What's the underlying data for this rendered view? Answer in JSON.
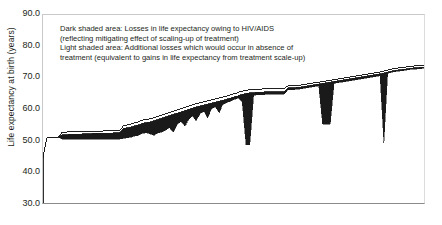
{
  "axis": {
    "y_title": "Life expectancy at birth (years)",
    "y_ticks": [
      "90.0",
      "80.0",
      "70.0",
      "60.0",
      "50.0",
      "40.0",
      "30.0"
    ]
  },
  "legend": {
    "line1": "Dark shaded area: Losses in life expectancy owing to HIV/AIDS",
    "line2": "(reflecting mitigating effect of scaling-up of treatment)",
    "line3": "Light shaded area: Additional losses which would occur in absence of",
    "line4": "treatment (equivalent to gains in life expectancy from treatment scale-up)"
  },
  "country_labels": [
    {
      "name": "Sierra Leone",
      "text": "Sierra\nLeone",
      "orient": "horiz",
      "x": 2,
      "y": 147
    },
    {
      "name": "Nigeria",
      "text": "Nigeria",
      "orient": "horiz",
      "x": 22,
      "y": 112
    },
    {
      "name": "Mozambique",
      "text": "Mo-\nzam-\nbique",
      "orient": "horiz",
      "x": 61,
      "y": 147
    },
    {
      "name": "Malawi",
      "text": "Malawi",
      "orient": "vert",
      "x": 101,
      "y": 178
    },
    {
      "name": "Zambia",
      "text": "Zambia",
      "orient": "vert",
      "x": 131,
      "y": 166
    },
    {
      "name": "Swaziland",
      "text": "Swazi-\nland",
      "orient": "horiz",
      "x": 118,
      "y": 161
    },
    {
      "name": "Lesotho",
      "text": "Lesotho",
      "orient": "vert",
      "x": 166,
      "y": 173
    },
    {
      "name": "South Africa",
      "text": "South Africa",
      "orient": "vert",
      "x": 213,
      "y": 180
    },
    {
      "name": "Zimbabwe",
      "text": "Zimbabwe",
      "orient": "vert",
      "x": 251,
      "y": 180
    },
    {
      "name": "Namibia Botswana",
      "text": "Namibia,\nBotswana",
      "orient": "vert",
      "x": 265,
      "y": 180
    }
  ],
  "chart_data": {
    "type": "area",
    "title": "",
    "xlabel": "",
    "ylabel": "Life expectancy at birth (years)",
    "ylim": [
      30.0,
      90.0
    ],
    "y_ticks": [
      30.0,
      40.0,
      50.0,
      60.0,
      70.0,
      80.0,
      90.0
    ],
    "grid": false,
    "legend_position": "inside-top-left",
    "colors": {
      "dark_shade": "#1a1a1a",
      "light_shade": "#ffffff",
      "line": "#1a1a1a",
      "frame": "#8a8a8a"
    },
    "series": [
      {
        "name": "Life expectancy with treatment scale-up (upper outline)",
        "description": "Rising step curve of country life expectancies sorted ascending",
        "x": [
          0,
          1,
          2,
          3,
          4,
          5,
          6,
          7,
          8,
          9,
          10,
          11,
          12,
          13,
          14,
          15,
          16,
          17,
          18,
          19,
          20,
          21,
          22,
          23,
          24,
          25,
          26,
          27,
          28,
          29,
          30,
          31,
          32,
          33,
          34,
          35,
          36,
          37,
          38,
          39,
          40,
          41,
          42,
          43,
          44,
          45,
          46,
          47,
          48,
          49,
          50,
          51,
          52,
          53,
          54,
          55,
          56,
          57,
          58,
          59,
          60,
          61,
          62,
          63,
          64,
          65,
          66,
          67,
          68,
          69,
          70,
          71,
          72,
          73,
          74,
          75,
          76,
          77,
          78,
          79,
          80,
          81,
          82,
          83,
          84,
          85,
          86,
          87,
          88,
          89,
          90,
          91,
          92,
          93,
          94,
          95,
          96,
          97,
          98,
          99,
          100
        ],
        "values": [
          45.0,
          51.2,
          51.2,
          51.2,
          51.4,
          53.0,
          53.0,
          53.2,
          53.2,
          53.2,
          53.2,
          53.3,
          53.3,
          53.3,
          53.3,
          53.3,
          53.4,
          53.4,
          53.4,
          53.4,
          53.5,
          55.0,
          55.3,
          55.6,
          56.0,
          56.3,
          56.8,
          57.0,
          57.2,
          57.6,
          58.0,
          58.4,
          58.8,
          59.2,
          59.6,
          60.0,
          60.4,
          60.8,
          61.2,
          61.6,
          62.0,
          62.3,
          62.6,
          62.9,
          63.2,
          63.5,
          63.8,
          64.1,
          64.4,
          64.8,
          65.2,
          65.6,
          65.9,
          66.2,
          66.4,
          66.5,
          66.6,
          66.6,
          66.7,
          66.7,
          66.7,
          66.8,
          66.8,
          66.8,
          67.6,
          67.6,
          67.7,
          67.8,
          68.0,
          68.2,
          68.4,
          68.6,
          68.8,
          69.0,
          69.2,
          69.4,
          69.6,
          69.8,
          70.0,
          70.2,
          70.4,
          70.6,
          70.8,
          71.0,
          71.2,
          71.4,
          71.6,
          71.8,
          72.0,
          72.3,
          72.6,
          72.9,
          73.1,
          73.3,
          73.4,
          73.6,
          73.8,
          73.9,
          74.0,
          74.1,
          74.2
        ]
      },
      {
        "name": "Life expectancy with current treatment (boundary dark/light)",
        "description": "Lower edge of light band; top of dark band",
        "x": [
          0,
          1,
          2,
          3,
          4,
          5,
          6,
          7,
          8,
          9,
          10,
          11,
          12,
          13,
          14,
          15,
          16,
          17,
          18,
          19,
          20,
          21,
          22,
          23,
          24,
          25,
          26,
          27,
          28,
          29,
          30,
          31,
          32,
          33,
          34,
          35,
          36,
          37,
          38,
          39,
          40,
          41,
          42,
          43,
          44,
          45,
          46,
          47,
          48,
          49,
          50,
          51,
          52,
          53,
          54,
          55,
          56,
          57,
          58,
          59,
          60,
          61,
          62,
          63,
          64,
          65,
          66,
          67,
          68,
          69,
          70,
          71,
          72,
          73,
          74,
          75,
          76,
          77,
          78,
          79,
          80,
          81,
          82,
          83,
          84,
          85,
          86,
          87,
          88,
          89,
          90,
          91,
          92,
          93,
          94,
          95,
          96,
          97,
          98,
          99,
          100
        ],
        "values": [
          45.0,
          51.2,
          51.2,
          51.2,
          51.4,
          52.2,
          52.2,
          52.3,
          52.3,
          52.4,
          52.4,
          52.5,
          52.5,
          52.6,
          52.6,
          52.6,
          52.7,
          52.7,
          52.7,
          52.8,
          52.8,
          54.2,
          54.4,
          54.6,
          55.0,
          55.3,
          55.8,
          56.0,
          56.2,
          56.6,
          57.0,
          57.4,
          57.8,
          58.2,
          58.6,
          59.0,
          59.4,
          59.8,
          60.2,
          60.6,
          61.0,
          61.3,
          61.6,
          61.9,
          62.2,
          62.5,
          62.8,
          63.1,
          63.4,
          63.8,
          64.2,
          64.6,
          64.9,
          65.2,
          65.4,
          65.5,
          65.6,
          65.6,
          65.7,
          65.7,
          65.7,
          65.8,
          65.8,
          65.8,
          67.0,
          67.0,
          67.1,
          67.2,
          67.4,
          67.6,
          67.8,
          68.0,
          68.2,
          68.4,
          68.6,
          68.8,
          69.0,
          69.2,
          69.4,
          69.6,
          69.8,
          70.0,
          70.2,
          70.4,
          70.6,
          70.8,
          71.0,
          71.2,
          71.4,
          71.7,
          72.0,
          72.3,
          72.5,
          72.7,
          72.8,
          73.0,
          73.2,
          73.3,
          73.4,
          73.5,
          73.6
        ]
      },
      {
        "name": "Life expectancy without any treatment (bottom of dark band)",
        "description": "Lower edge of dark band; deep dips at Lesotho, South Africa, Zimbabwe",
        "x": [
          0,
          1,
          2,
          3,
          4,
          5,
          6,
          7,
          8,
          9,
          10,
          11,
          12,
          13,
          14,
          15,
          16,
          17,
          18,
          19,
          20,
          21,
          22,
          23,
          24,
          25,
          26,
          27,
          28,
          29,
          30,
          31,
          32,
          33,
          34,
          35,
          36,
          37,
          38,
          39,
          40,
          41,
          42,
          43,
          44,
          45,
          46,
          47,
          48,
          49,
          50,
          51,
          52,
          53,
          54,
          55,
          56,
          57,
          58,
          59,
          60,
          61,
          62,
          63,
          64,
          65,
          66,
          67,
          68,
          69,
          70,
          71,
          72,
          73,
          74,
          75,
          76,
          77,
          78,
          79,
          80,
          81,
          82,
          83,
          84,
          85,
          86,
          87,
          88,
          89,
          90,
          91,
          92,
          93,
          94,
          95,
          96,
          97,
          98,
          99,
          100
        ],
        "values": [
          45.0,
          51.2,
          51.2,
          51.2,
          51.4,
          50.8,
          50.8,
          50.8,
          50.8,
          50.8,
          50.8,
          50.8,
          50.8,
          50.8,
          50.8,
          50.8,
          50.8,
          50.8,
          50.8,
          50.8,
          50.8,
          51.0,
          51.2,
          51.4,
          51.8,
          52.0,
          52.6,
          52.8,
          52.4,
          52.0,
          52.8,
          53.0,
          53.6,
          54.4,
          53.0,
          55.4,
          56.4,
          55.0,
          57.0,
          58.2,
          56.6,
          58.8,
          59.6,
          57.4,
          60.4,
          61.0,
          59.2,
          61.8,
          62.4,
          62.8,
          63.4,
          63.8,
          62.6,
          49.0,
          49.0,
          64.6,
          64.8,
          64.8,
          64.9,
          64.9,
          64.9,
          65.0,
          65.0,
          65.0,
          66.4,
          66.4,
          66.5,
          66.6,
          66.8,
          67.0,
          67.2,
          67.4,
          67.6,
          55.5,
          55.5,
          55.5,
          68.4,
          68.6,
          68.8,
          69.0,
          69.2,
          69.4,
          69.6,
          69.8,
          70.0,
          70.2,
          70.4,
          70.6,
          70.8,
          49.5,
          71.6,
          71.9,
          72.1,
          72.3,
          72.4,
          72.6,
          72.8,
          72.9,
          73.0,
          73.1,
          73.2
        ]
      }
    ]
  }
}
